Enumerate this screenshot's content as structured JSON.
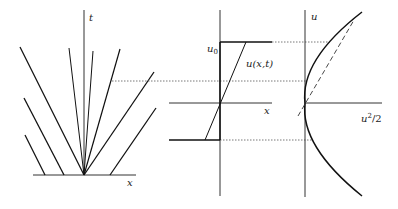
{
  "figure": {
    "panels": [
      {
        "id": "characteristics",
        "axis_labels": {
          "x": "x",
          "t": "t"
        }
      },
      {
        "id": "initial-profile",
        "axis_labels": {
          "x": "x",
          "u0": "u",
          "u0_sub": "0",
          "curve": "u(x,t)"
        }
      },
      {
        "id": "flux",
        "axis_labels": {
          "u": "u",
          "flux": "u",
          "flux_sup": "2",
          "flux_tail": "/2"
        }
      }
    ],
    "colors": {
      "line": "#111111",
      "axis": "#333333",
      "dotted": "#555555"
    }
  }
}
